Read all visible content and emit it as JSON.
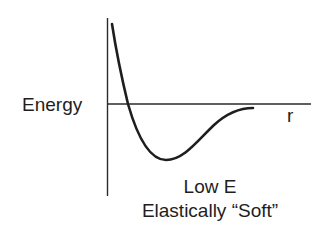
{
  "diagram": {
    "y_axis_label": "Energy",
    "x_axis_label": "r",
    "caption": {
      "line1": "Low E",
      "line2": "Elastically “Soft”"
    },
    "colors": {
      "line": "#1e1e1e",
      "axis": "#2a2a2a",
      "background": "#ffffff"
    }
  }
}
